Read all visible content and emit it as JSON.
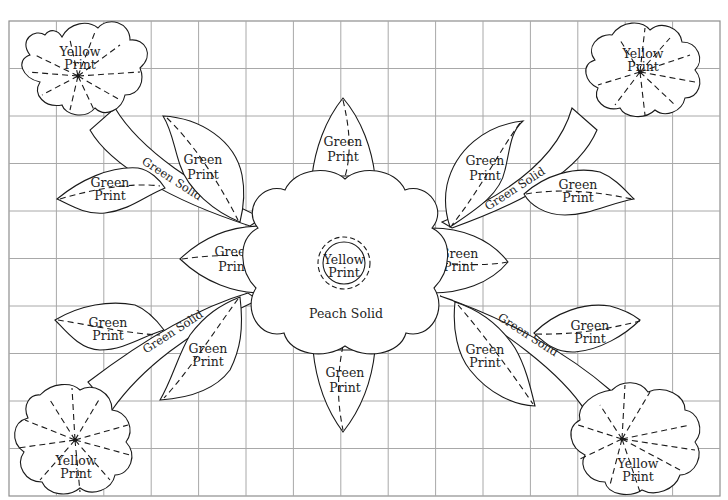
{
  "diagram": {
    "type": "quilt-applique-pattern",
    "grid": {
      "columns": 15,
      "rows": 10,
      "color": "#a8a8a8"
    },
    "center_flower": {
      "fabric_label": "Peach Solid",
      "center_label_line1": "Yellow",
      "center_label_line2": "Print"
    },
    "corner_flowers": [
      {
        "position": "top-left",
        "label_line1": "Yellow",
        "label_line2": "Print"
      },
      {
        "position": "top-right",
        "label_line1": "Yellow",
        "label_line2": "Print"
      },
      {
        "position": "bottom-left",
        "label_line1": "Yellow",
        "label_line2": "Print"
      },
      {
        "position": "bottom-right",
        "label_line1": "Yellow",
        "label_line2": "Print"
      }
    ],
    "stems": [
      {
        "position": "top-left",
        "label": "Green Solid"
      },
      {
        "position": "top-right",
        "label": "Green Solid"
      },
      {
        "position": "bottom-left",
        "label": "Green Solid"
      },
      {
        "position": "bottom-right",
        "label": "Green Solid"
      }
    ],
    "leaves": [
      {
        "position": "top-center",
        "label_line1": "Green",
        "label_line2": "Print"
      },
      {
        "position": "bottom-center",
        "label_line1": "Green",
        "label_line2": "Print"
      },
      {
        "position": "left-center",
        "label_line1": "Green",
        "label_line2": "Print"
      },
      {
        "position": "right-center",
        "label_line1": "Green",
        "label_line2": "Print"
      },
      {
        "position": "top-left-upper",
        "label_line1": "Green",
        "label_line2": "Print"
      },
      {
        "position": "top-left-lower",
        "label_line1": "Green",
        "label_line2": "Print"
      },
      {
        "position": "top-right-upper",
        "label_line1": "Green",
        "label_line2": "Print"
      },
      {
        "position": "top-right-lower",
        "label_line1": "Green",
        "label_line2": "Print"
      },
      {
        "position": "bottom-left-upper",
        "label_line1": "Green",
        "label_line2": "Print"
      },
      {
        "position": "bottom-left-lower",
        "label_line1": "Green",
        "label_line2": "Print"
      },
      {
        "position": "bottom-right-upper",
        "label_line1": "Green",
        "label_line2": "Print"
      },
      {
        "position": "bottom-right-lower",
        "label_line1": "Green",
        "label_line2": "Print"
      }
    ]
  }
}
